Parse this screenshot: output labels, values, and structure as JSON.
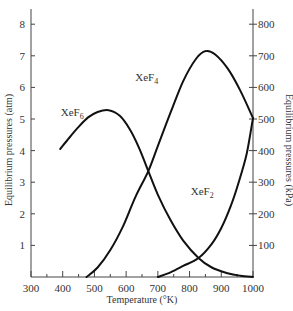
{
  "chart_data": {
    "type": "line",
    "title": "",
    "xlabel": "Temperature (°K)",
    "ylabel": "Equilibrium pressures (atm)",
    "ylabel_right": "Equilibrium pressures (kPa)",
    "xlim": [
      300,
      1000
    ],
    "ylim": [
      0,
      8.5
    ],
    "ylim_right_kPa": [
      0,
      850
    ],
    "grid": false,
    "legend": "inline labels on curves",
    "x_ticks": [
      300,
      400,
      500,
      600,
      700,
      800,
      900,
      1000
    ],
    "y_ticks": [
      1,
      2,
      3,
      4,
      5,
      6,
      7,
      8
    ],
    "y_ticks_right": [
      100,
      200,
      300,
      400,
      500,
      600,
      700,
      800
    ],
    "series": [
      {
        "name": "XeF6",
        "label_main": "XeF",
        "label_sub": "6",
        "points": [
          [
            392,
            4.05
          ],
          [
            420,
            4.4
          ],
          [
            450,
            4.75
          ],
          [
            480,
            5.05
          ],
          [
            510,
            5.22
          ],
          [
            545,
            5.28
          ],
          [
            580,
            5.1
          ],
          [
            610,
            4.7
          ],
          [
            640,
            4.1
          ],
          [
            670,
            3.35
          ],
          [
            700,
            2.6
          ],
          [
            740,
            1.8
          ],
          [
            780,
            1.15
          ],
          [
            828,
            0.6
          ],
          [
            870,
            0.3
          ],
          [
            920,
            0.12
          ],
          [
            960,
            0.04
          ],
          [
            1000,
            0.0
          ]
        ]
      },
      {
        "name": "XeF4",
        "label_main": "XeF",
        "label_sub": "4",
        "points": [
          [
            475,
            0.0
          ],
          [
            510,
            0.3
          ],
          [
            550,
            0.85
          ],
          [
            590,
            1.6
          ],
          [
            630,
            2.55
          ],
          [
            670,
            3.35
          ],
          [
            700,
            4.15
          ],
          [
            740,
            5.2
          ],
          [
            780,
            6.2
          ],
          [
            820,
            6.9
          ],
          [
            851,
            7.15
          ],
          [
            880,
            7.05
          ],
          [
            920,
            6.6
          ],
          [
            960,
            5.9
          ],
          [
            1000,
            5.03
          ]
        ]
      },
      {
        "name": "XeF2",
        "label_main": "XeF",
        "label_sub": "2",
        "points": [
          [
            700,
            0.0
          ],
          [
            740,
            0.15
          ],
          [
            780,
            0.35
          ],
          [
            828,
            0.6
          ],
          [
            870,
            1.05
          ],
          [
            900,
            1.55
          ],
          [
            930,
            2.25
          ],
          [
            955,
            3.0
          ],
          [
            980,
            3.9
          ],
          [
            1000,
            5.03
          ]
        ]
      }
    ],
    "annotations": [
      {
        "text": "XeF6",
        "x": 430,
        "y": 5.1
      },
      {
        "text": "XeF4",
        "x": 665,
        "y": 6.2
      },
      {
        "text": "XeF2",
        "x": 840,
        "y": 2.6
      }
    ]
  }
}
